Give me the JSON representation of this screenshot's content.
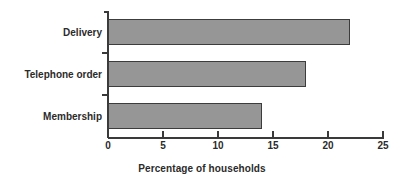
{
  "chart_data": {
    "type": "bar",
    "orientation": "horizontal",
    "title": "",
    "subtitle": "",
    "xlabel": "Percentage of households",
    "ylabel": "",
    "categories": [
      "Delivery",
      "Telephone order",
      "Membership"
    ],
    "values": [
      22,
      18,
      14
    ],
    "xlim": [
      0,
      25
    ],
    "xticks": [
      0,
      5,
      10,
      15,
      20,
      25
    ],
    "xtick_labels": [
      "0",
      "5",
      "10",
      "15",
      "20",
      "25"
    ],
    "grid": false,
    "legend": null,
    "series": [
      {
        "name": "Percentage of households",
        "values": [
          22,
          18,
          14
        ]
      }
    ],
    "colors": {
      "bar_fill": "#969696",
      "bar_border": "#3c3c3c",
      "axis": "#3a3a3a",
      "text": "#2b2b2b",
      "background": "#ffffff"
    }
  }
}
